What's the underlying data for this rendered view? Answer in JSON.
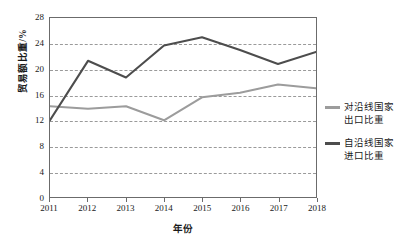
{
  "chart_data": {
    "type": "line",
    "title": "",
    "xlabel": "年份",
    "ylabel": "贸易额比重/%",
    "categories": [
      "2011",
      "2012",
      "2013",
      "2014",
      "2015",
      "2016",
      "2017",
      "2018"
    ],
    "x": [
      2011,
      2012,
      2013,
      2014,
      2015,
      2016,
      2017,
      2018
    ],
    "xlim": [
      2011,
      2018
    ],
    "ylim": [
      0,
      28
    ],
    "yticks": [
      0,
      4,
      8,
      12,
      16,
      20,
      24,
      28
    ],
    "grid": "horizontal-dashed",
    "legend_position": "right",
    "series": [
      {
        "name": "对沿线国家出口比重",
        "legend_label": "对沿线国家\n出口比重",
        "color": "#9c9c9c",
        "values": [
          14.2,
          13.8,
          14.2,
          12.0,
          15.6,
          16.3,
          17.6,
          17.0
        ]
      },
      {
        "name": "自沿线国家进口比重",
        "legend_label": "自沿线国家\n进口比重",
        "color": "#4d4d4d",
        "values": [
          12.0,
          21.3,
          18.7,
          23.7,
          25.0,
          23.0,
          20.8,
          22.7
        ]
      }
    ]
  },
  "colors": {
    "axis": "#6b6b6b",
    "grid": "#9a9a9a",
    "background": "#ffffff",
    "text": "#1a1a1a"
  }
}
